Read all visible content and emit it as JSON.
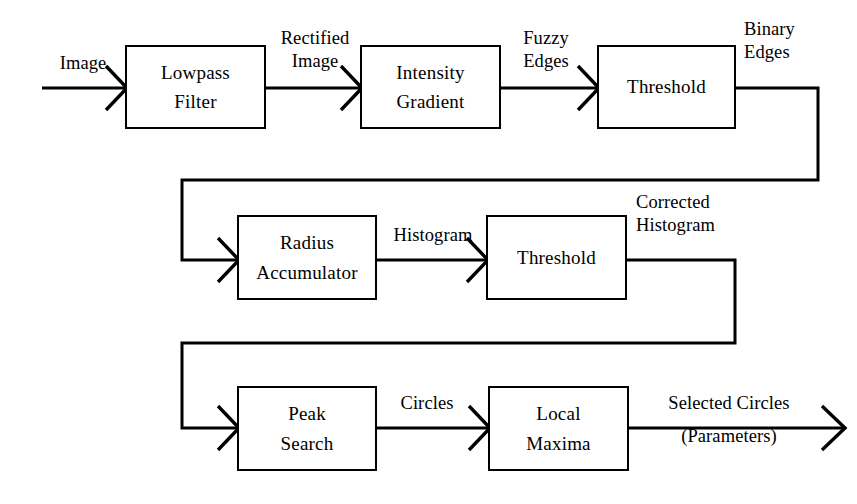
{
  "diagram": {
    "background_color": "#ffffff",
    "line_color": "#000000",
    "nodes": [
      {
        "id": "lowpass-filter",
        "line1": "Lowpass",
        "line2": "Filter"
      },
      {
        "id": "intensity-gradient",
        "line1": "Intensity",
        "line2": "Gradient"
      },
      {
        "id": "threshold-1",
        "line1": "Threshold",
        "line2": ""
      },
      {
        "id": "radius-accumulator",
        "line1": "Radius",
        "line2": "Accumulator"
      },
      {
        "id": "threshold-2",
        "line1": "Threshold",
        "line2": ""
      },
      {
        "id": "peak-search",
        "line1": "Peak",
        "line2": "Search"
      },
      {
        "id": "local-maxima",
        "line1": "Local",
        "line2": "Maxima"
      }
    ],
    "edge_labels": [
      {
        "id": "image",
        "line1": "Image",
        "line2": ""
      },
      {
        "id": "rectified-image",
        "line1": "Rectified",
        "line2": "Image"
      },
      {
        "id": "fuzzy-edges",
        "line1": "Fuzzy",
        "line2": "Edges"
      },
      {
        "id": "binary-edges",
        "line1": "Binary",
        "line2": "Edges"
      },
      {
        "id": "histogram",
        "line1": "Histogram",
        "line2": ""
      },
      {
        "id": "corrected-histogram",
        "line1": "Corrected",
        "line2": "Histogram"
      },
      {
        "id": "circles",
        "line1": "Circles",
        "line2": ""
      },
      {
        "id": "selected-circles",
        "line1": "Selected Circles",
        "line2": "(Parameters)"
      }
    ]
  }
}
